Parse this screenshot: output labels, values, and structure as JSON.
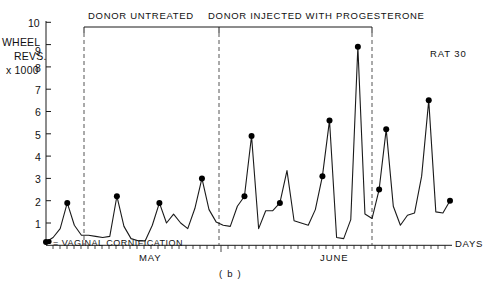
{
  "figure": {
    "panel_label": "( b )",
    "subject_label": "RAT 30",
    "y_axis_title_lines": [
      "WHEEL",
      "REVS.",
      "x 1000"
    ],
    "x_axis_title": "DAYS",
    "legend_text": "= VAGINAL CORNIFICATION",
    "phase_labels": [
      {
        "text": "DONOR UNTREATED"
      },
      {
        "text": "DONOR INJECTED WITH PROGESTERONE"
      }
    ],
    "month_labels": [
      "MAY",
      "JUNE"
    ],
    "y_tick_labels": [
      "10",
      "9",
      "8",
      "7",
      "6",
      "5",
      "4",
      "3",
      "2",
      "1"
    ],
    "colors": {
      "line": "#1a1a1a",
      "axis": "#1a1a1a",
      "marker": "#000000"
    }
  },
  "chart_data": {
    "type": "line",
    "title": "RAT 30",
    "xlabel": "DAYS",
    "ylabel": "WHEEL REVS. x 1000",
    "ylim": [
      0,
      10
    ],
    "yticks": [
      1,
      2,
      3,
      4,
      5,
      6,
      7,
      8,
      9,
      10
    ],
    "grid": false,
    "legend": "= VAGINAL CORNIFICATION",
    "x": [
      1,
      2,
      3,
      4,
      5,
      6,
      7,
      8,
      9,
      10,
      11,
      12,
      13,
      14,
      15,
      16,
      17,
      18,
      19,
      20,
      21,
      22,
      23,
      24,
      25,
      26,
      27,
      28,
      29,
      30,
      31,
      32,
      33,
      34,
      35,
      36,
      37,
      38,
      39,
      40,
      41,
      42,
      43,
      44,
      45,
      46,
      47,
      48,
      49,
      50,
      51,
      52,
      53,
      54,
      55,
      56,
      57,
      58
    ],
    "values": [
      0.15,
      0.35,
      0.75,
      1.9,
      0.9,
      0.45,
      0.45,
      0.4,
      0.35,
      0.4,
      2.2,
      0.85,
      0.3,
      0.2,
      0.2,
      0.9,
      1.9,
      1.0,
      1.4,
      1.0,
      0.75,
      1.65,
      3.0,
      1.6,
      1.05,
      0.9,
      0.85,
      1.75,
      2.2,
      4.9,
      0.75,
      1.55,
      1.55,
      1.9,
      3.35,
      1.1,
      1.0,
      0.9,
      1.6,
      3.1,
      5.6,
      0.35,
      0.3,
      1.15,
      8.9,
      1.4,
      1.2,
      2.5,
      5.2,
      1.75,
      0.9,
      1.35,
      1.45,
      3.1,
      6.5,
      1.5,
      1.45,
      2.0
    ],
    "cornification_points": [
      {
        "x": 1,
        "y": 0.15
      },
      {
        "x": 4,
        "y": 1.9
      },
      {
        "x": 11,
        "y": 2.2
      },
      {
        "x": 17,
        "y": 1.9
      },
      {
        "x": 23,
        "y": 3.0
      },
      {
        "x": 29,
        "y": 3.35
      },
      {
        "x": 30,
        "y": 4.9
      },
      {
        "x": 34,
        "y": 1.9
      },
      {
        "x": 41,
        "y": 5.6
      },
      {
        "x": 40,
        "y": 3.1
      },
      {
        "x": 45,
        "y": 8.9
      },
      {
        "x": 49,
        "y": 5.2
      },
      {
        "x": 48,
        "y": 2.5
      },
      {
        "x": 55,
        "y": 6.5
      },
      {
        "x": 58,
        "y": 7.6
      }
    ],
    "phase_markers": [
      {
        "label": "DONOR UNTREATED",
        "x_start": 9,
        "x_end": 26
      },
      {
        "label": "DONOR INJECTED WITH PROGESTERONE",
        "x_start": 26,
        "x_end": 48
      }
    ],
    "annotations": [
      {
        "text": "MAY",
        "position": "x-axis-left"
      },
      {
        "text": "JUNE",
        "position": "x-axis-right"
      },
      {
        "text": "RAT 30",
        "position": "top-right"
      },
      {
        "text": "( b )",
        "position": "below-axis-center"
      }
    ]
  }
}
